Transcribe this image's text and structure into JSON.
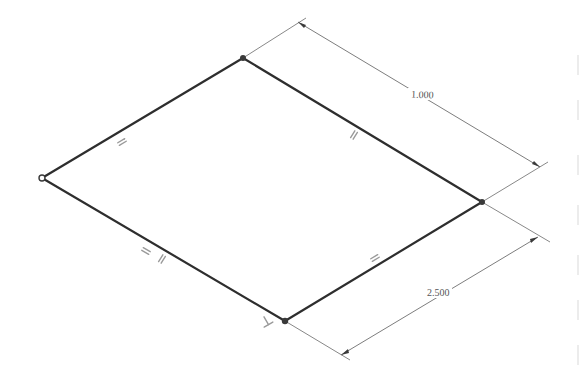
{
  "diagram": {
    "type": "isometric-sketch",
    "colors": {
      "edge": "#2e2e2e",
      "dimension": "#6e6e6e",
      "text": "#555555",
      "background": "#ffffff"
    },
    "vertices": [
      {
        "name": "top",
        "x": 243,
        "y": 58
      },
      {
        "name": "left",
        "x": 42,
        "y": 178
      },
      {
        "name": "bottom",
        "x": 285,
        "y": 321
      },
      {
        "name": "right",
        "x": 482,
        "y": 202
      }
    ],
    "constraints": [
      {
        "type": "parallel",
        "edge": "top-left"
      },
      {
        "type": "parallel",
        "edge": "top-right"
      },
      {
        "type": "parallel",
        "edge": "left-bottom"
      },
      {
        "type": "parallel",
        "edge": "bottom-right"
      },
      {
        "type": "perpendicular",
        "at": "bottom"
      }
    ],
    "dimensions": [
      {
        "label": "1.000",
        "between": [
          "top",
          "right"
        ]
      },
      {
        "label": "2.500",
        "between": [
          "right",
          "bottom"
        ]
      }
    ]
  }
}
